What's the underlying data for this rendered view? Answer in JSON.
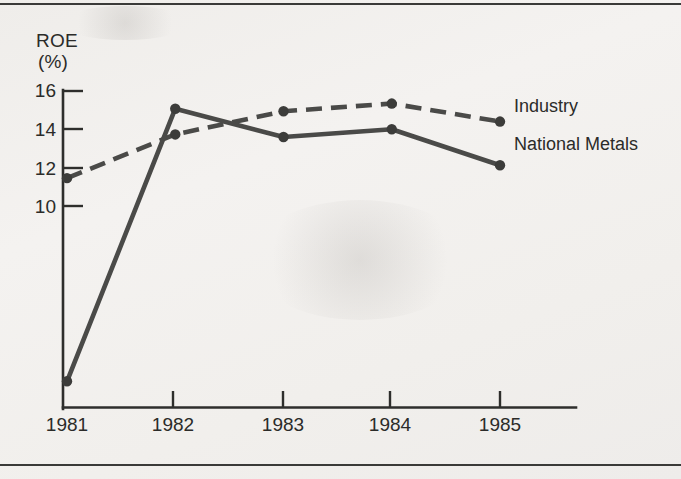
{
  "chart_data": {
    "type": "line",
    "title": "ROE\n(%)",
    "ylabel": "ROE (%)",
    "xlabel": "",
    "categories": [
      "1981",
      "1982",
      "1983",
      "1984",
      "1985"
    ],
    "x": [
      1981,
      1982,
      1983,
      1984,
      1985
    ],
    "ylim": [
      4,
      16.6
    ],
    "yticks": [
      10,
      12,
      14,
      16
    ],
    "ytick_labels": [
      "10",
      "12",
      "14",
      "16"
    ],
    "grid": false,
    "legend_position": "inline-right",
    "series": [
      {
        "name": "Industry",
        "style": "dashed",
        "color": "#4a4a48",
        "values": [
          12.9,
          14.6,
          15.5,
          15.8,
          15.1
        ]
      },
      {
        "name": "National Metals",
        "style": "solid",
        "color": "#4a4a48",
        "values": [
          5.0,
          15.6,
          14.5,
          14.8,
          13.4
        ]
      }
    ]
  },
  "axis": {
    "y_title_line1": "ROE",
    "y_title_line2": "(%)"
  },
  "legend": {
    "industry_label": "Industry",
    "national_metals_label": "National Metals"
  }
}
